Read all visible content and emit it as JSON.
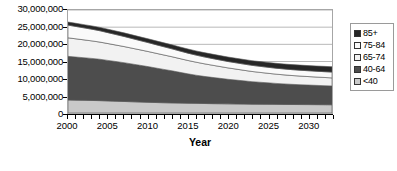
{
  "chart_data": {
    "type": "area",
    "stacked": true,
    "title": "",
    "xlabel": "Year",
    "ylabel": "",
    "xlim": [
      2000,
      2033
    ],
    "ylim": [
      0,
      30000000
    ],
    "grid": true,
    "legend_position": "right",
    "y_ticks": [
      0,
      5000000,
      10000000,
      15000000,
      20000000,
      25000000,
      30000000
    ],
    "y_tick_labels": [
      "0",
      "5,000,000",
      "10,000,000",
      "15,000,000",
      "20,000,000",
      "25,000,000",
      "30,000,000"
    ],
    "x_ticks": [
      2000,
      2005,
      2010,
      2015,
      2020,
      2025,
      2030
    ],
    "x_tick_labels": [
      "2000",
      "2005",
      "2010",
      "2015",
      "2020",
      "2025",
      "2030"
    ],
    "x_minor_tick_interval": 1,
    "x": [
      2000,
      2001,
      2002,
      2003,
      2004,
      2005,
      2006,
      2007,
      2008,
      2009,
      2010,
      2011,
      2012,
      2013,
      2014,
      2015,
      2016,
      2017,
      2018,
      2019,
      2020,
      2021,
      2022,
      2023,
      2024,
      2025,
      2026,
      2027,
      2028,
      2029,
      2030,
      2031,
      2032,
      2033
    ],
    "stack_order_bottom_to_top": [
      "<40",
      "40-64",
      "65-74",
      "75-84",
      "85+"
    ],
    "series": [
      {
        "name": "<40",
        "color": "#c9c9c9",
        "values": [
          3800000,
          3750000,
          3700000,
          3650000,
          3600000,
          3520000,
          3440000,
          3360000,
          3280000,
          3200000,
          3120000,
          3050000,
          2990000,
          2940000,
          2890000,
          2850000,
          2810000,
          2770000,
          2730000,
          2700000,
          2670000,
          2640000,
          2610000,
          2580000,
          2560000,
          2540000,
          2520000,
          2500000,
          2480000,
          2465000,
          2450000,
          2435000,
          2420000,
          2400000
        ]
      },
      {
        "name": "40-64",
        "color": "#4d4d4d",
        "values": [
          12700000,
          12550000,
          12400000,
          12250000,
          12050000,
          11800000,
          11550000,
          11300000,
          11000000,
          10700000,
          10400000,
          10050000,
          9700000,
          9350000,
          8950000,
          8550000,
          8200000,
          7900000,
          7650000,
          7400000,
          7150000,
          6950000,
          6750000,
          6550000,
          6400000,
          6250000,
          6100000,
          5980000,
          5870000,
          5780000,
          5700000,
          5620000,
          5550000,
          5480000
        ]
      },
      {
        "name": "65-74",
        "color": "#f2f2f2",
        "values": [
          5400000,
          5300000,
          5200000,
          5100000,
          5000000,
          4900000,
          4800000,
          4700000,
          4600000,
          4500000,
          4400000,
          4300000,
          4200000,
          4100000,
          4000000,
          3900000,
          3800000,
          3680000,
          3560000,
          3440000,
          3320000,
          3200000,
          3080000,
          2970000,
          2870000,
          2780000,
          2700000,
          2630000,
          2570000,
          2520000,
          2470000,
          2430000,
          2390000,
          2350000
        ]
      },
      {
        "name": "75-84",
        "color": "#fafafa",
        "values": [
          3700000,
          3600000,
          3500000,
          3400000,
          3300000,
          3180000,
          3060000,
          2940000,
          2820000,
          2700000,
          2600000,
          2500000,
          2400000,
          2300000,
          2210000,
          2130000,
          2060000,
          2000000,
          1950000,
          1900000,
          1860000,
          1830000,
          1800000,
          1780000,
          1760000,
          1745000,
          1730000,
          1720000,
          1710000,
          1700000,
          1695000,
          1690000,
          1685000,
          1680000
        ]
      },
      {
        "name": "85+",
        "color": "#262626",
        "values": [
          900000,
          920000,
          940000,
          960000,
          980000,
          1000000,
          1020000,
          1040000,
          1060000,
          1080000,
          1100000,
          1120000,
          1140000,
          1160000,
          1180000,
          1200000,
          1220000,
          1240000,
          1260000,
          1280000,
          1300000,
          1320000,
          1340000,
          1360000,
          1380000,
          1400000,
          1420000,
          1440000,
          1460000,
          1480000,
          1500000,
          1520000,
          1540000,
          1560000
        ]
      }
    ]
  },
  "legend": {
    "items": [
      {
        "label": "85+",
        "color": "#262626"
      },
      {
        "label": "75-84",
        "color": "#fafafa"
      },
      {
        "label": "65-74",
        "color": "#f2f2f2"
      },
      {
        "label": "40-64",
        "color": "#4d4d4d"
      },
      {
        "label": "<40",
        "color": "#c9c9c9"
      }
    ]
  },
  "axis": {
    "x_title": "Year"
  },
  "caption": {
    "text": ""
  }
}
